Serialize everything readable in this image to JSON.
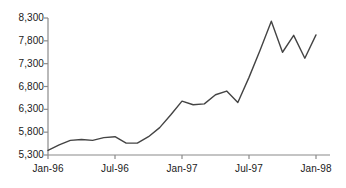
{
  "chart_data": {
    "type": "line",
    "title": "",
    "subtitle": "",
    "xlabel": "",
    "ylabel": "",
    "grid": false,
    "legend": "none",
    "ylim": [
      5300,
      8300
    ],
    "yticks": [
      5300,
      5800,
      6300,
      6800,
      7300,
      7800,
      8300
    ],
    "ytick_labels": [
      "5,300",
      "5,800",
      "6,300",
      "6,800",
      "7,300",
      "7,800",
      "8,300"
    ],
    "xticks": [
      "Jan-96",
      "Jul-96",
      "Jan-97",
      "Jul-97",
      "Jan-98"
    ],
    "xtick_labels": [
      "Jan-96",
      "Jul-96",
      "Jan-97",
      "Jul-97",
      "Jan-98"
    ],
    "xlim": [
      "Jan-96",
      "Jan-98"
    ],
    "line_color": "#444444",
    "axis_color": "#888888",
    "x": [
      "Jan-96",
      "Feb-96",
      "Mar-96",
      "Apr-96",
      "May-96",
      "Jun-96",
      "Jul-96",
      "Aug-96",
      "Sep-96",
      "Oct-96",
      "Nov-96",
      "Dec-96",
      "Jan-97",
      "Feb-97",
      "Mar-97",
      "Apr-97",
      "May-97",
      "Jun-97",
      "Jul-97",
      "Aug-97",
      "Sep-97",
      "Oct-97",
      "Nov-97",
      "Dec-97",
      "Jan-98"
    ],
    "values": [
      5400,
      5520,
      5620,
      5640,
      5620,
      5680,
      5700,
      5560,
      5560,
      5700,
      5900,
      6180,
      6480,
      6400,
      6420,
      6620,
      6700,
      6450,
      7000,
      7600,
      8230,
      7550,
      7920,
      7420,
      7930
    ],
    "series": [
      {
        "name": "series-1",
        "values": [
          5400,
          5520,
          5620,
          5640,
          5620,
          5680,
          5700,
          5560,
          5560,
          5700,
          5900,
          6180,
          6480,
          6400,
          6420,
          6620,
          6700,
          6450,
          7000,
          7600,
          8230,
          7550,
          7920,
          7420,
          7930
        ]
      }
    ],
    "annotations": []
  }
}
